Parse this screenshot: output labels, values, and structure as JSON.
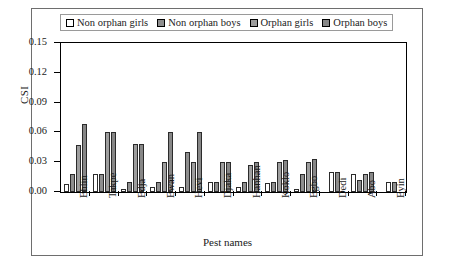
{
  "figure": {
    "legend_position": "top-center",
    "frame": true
  },
  "chart_data": {
    "type": "bar",
    "title": "",
    "xlabel": "Pest names",
    "ylabel": "CSI",
    "ylim": [
      0.0,
      0.15
    ],
    "yticks": [
      "0.00",
      "0.03",
      "0.06",
      "0.09",
      "0.12",
      "0.15"
    ],
    "ytick_values": [
      0.0,
      0.03,
      0.06,
      0.09,
      0.12,
      0.15
    ],
    "grid": false,
    "legend": [
      "Non orphan girls",
      "Non orphan boys",
      "Orphan girls",
      "Orphan boys"
    ],
    "legend_colors": [
      "#ffffff",
      "#8e8e8e",
      "#9e9e9e",
      "#878787"
    ],
    "categories": [
      "Ehlin",
      "Takpe",
      "Edja",
      "Ewan",
      "Hevi",
      "Djaka",
      "Hanhan",
      "Koklo",
      "Egbo",
      "Dedi",
      "Abo",
      "Eyin"
    ],
    "series": [
      {
        "name": "Non orphan girls",
        "color": "#ffffff",
        "values": [
          0.008,
          0.018,
          0.003,
          0.005,
          0.005,
          0.01,
          0.005,
          0.009,
          0.003,
          0.02,
          0.018,
          0.01
        ]
      },
      {
        "name": "Non orphan boys",
        "color": "#8e8e8e",
        "values": [
          0.018,
          0.018,
          0.01,
          0.01,
          0.04,
          0.01,
          0.01,
          0.01,
          0.018,
          0.02,
          0.012,
          0.01
        ]
      },
      {
        "name": "Orphan girls",
        "color": "#9e9e9e",
        "values": [
          0.047,
          0.06,
          0.048,
          0.03,
          0.03,
          0.03,
          0.027,
          0.03,
          0.03,
          0.0,
          0.018,
          0.0
        ]
      },
      {
        "name": "Orphan boys",
        "color": "#878787",
        "values": [
          0.068,
          0.06,
          0.048,
          0.06,
          0.06,
          0.03,
          0.03,
          0.032,
          0.033,
          0.0,
          0.02,
          0.0
        ]
      }
    ]
  }
}
